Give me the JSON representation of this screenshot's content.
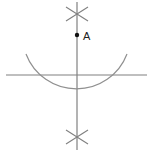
{
  "diagram": {
    "type": "perpendicular-from-point-construction",
    "point": {
      "label": "A",
      "x": 77,
      "y": 35
    },
    "given_line": {
      "x1": 6,
      "y1": 75,
      "x2": 147,
      "y2": 75
    },
    "perpendicular_line": {
      "x1": 77,
      "y1": 2,
      "x2": 77,
      "y2": 150
    },
    "arc": {
      "cx": 77,
      "cy": 37,
      "r": 54,
      "start_deg": 20,
      "end_deg": 160
    },
    "arc_intersection_marks": [
      {
        "name": "top",
        "x": 77,
        "y": 14
      },
      {
        "name": "bottom",
        "x": 77,
        "y": 137
      }
    ],
    "colors": {
      "line": "#808080",
      "point": "#111111",
      "text": "#222222"
    }
  }
}
